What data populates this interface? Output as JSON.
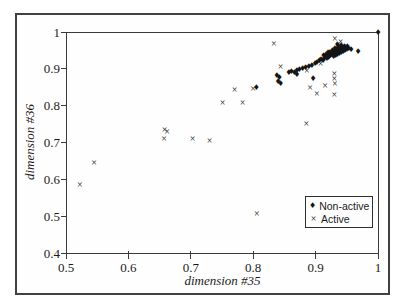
{
  "figure": {
    "background_color": "#ffffff",
    "frame_color": "#414141",
    "axis_color": "#3a3a3a",
    "marker_color": "#141414"
  },
  "chart_data": {
    "type": "scatter",
    "title": "",
    "xlabel": "dimension #35",
    "ylabel": "dimension #36",
    "xlim": [
      0.5,
      1.0
    ],
    "ylim": [
      0.4,
      1.0
    ],
    "grid": false,
    "x_ticks": [
      {
        "label": "0.5",
        "value": 0.5
      },
      {
        "label": "0.6",
        "value": 0.6
      },
      {
        "label": "0.7",
        "value": 0.7
      },
      {
        "label": "0.8",
        "value": 0.8
      },
      {
        "label": "0.9",
        "value": 0.9
      },
      {
        "label": "1",
        "value": 1.0
      }
    ],
    "y_ticks": [
      {
        "label": "1",
        "value": 1.0
      },
      {
        "label": "0.9",
        "value": 0.9
      },
      {
        "label": "0.8",
        "value": 0.8
      },
      {
        "label": "0.7",
        "value": 0.7
      },
      {
        "label": "0.6",
        "value": 0.6
      },
      {
        "label": "0.5",
        "value": 0.5
      },
      {
        "label": "0.4",
        "value": 0.4
      }
    ],
    "glyphs": {
      "diamond": "♦",
      "x": "×"
    },
    "legend": {
      "position": "lower-right",
      "entries": [
        {
          "label": "Non-active",
          "marker": "diamond"
        },
        {
          "label": "Active",
          "marker": "x"
        }
      ]
    },
    "series": [
      {
        "name": "Non-active",
        "marker": "diamond",
        "points": [
          [
            1.0,
            0.997
          ],
          [
            0.957,
            0.951
          ],
          [
            0.968,
            0.946
          ],
          [
            0.906,
            0.921
          ],
          [
            0.909,
            0.925
          ],
          [
            0.912,
            0.922
          ],
          [
            0.914,
            0.928
          ],
          [
            0.916,
            0.932
          ],
          [
            0.918,
            0.926
          ],
          [
            0.919,
            0.934
          ],
          [
            0.921,
            0.93
          ],
          [
            0.922,
            0.938
          ],
          [
            0.924,
            0.934
          ],
          [
            0.925,
            0.941
          ],
          [
            0.926,
            0.937
          ],
          [
            0.928,
            0.944
          ],
          [
            0.929,
            0.933
          ],
          [
            0.93,
            0.94
          ],
          [
            0.931,
            0.947
          ],
          [
            0.932,
            0.936
          ],
          [
            0.933,
            0.943
          ],
          [
            0.934,
            0.95
          ],
          [
            0.935,
            0.938
          ],
          [
            0.936,
            0.945
          ],
          [
            0.937,
            0.952
          ],
          [
            0.938,
            0.941
          ],
          [
            0.939,
            0.948
          ],
          [
            0.94,
            0.955
          ],
          [
            0.941,
            0.944
          ],
          [
            0.942,
            0.95
          ],
          [
            0.943,
            0.957
          ],
          [
            0.944,
            0.946
          ],
          [
            0.945,
            0.953
          ],
          [
            0.946,
            0.96
          ],
          [
            0.947,
            0.949
          ],
          [
            0.948,
            0.956
          ],
          [
            0.95,
            0.952
          ],
          [
            0.951,
            0.958
          ],
          [
            0.953,
            0.954
          ],
          [
            0.927,
            0.948
          ],
          [
            0.923,
            0.944
          ],
          [
            0.917,
            0.938
          ],
          [
            0.913,
            0.934
          ],
          [
            0.92,
            0.942
          ],
          [
            0.936,
            0.958
          ],
          [
            0.931,
            0.954
          ],
          [
            0.941,
            0.962
          ],
          [
            0.935,
            0.964
          ],
          [
            0.857,
            0.888
          ],
          [
            0.861,
            0.892
          ],
          [
            0.866,
            0.89
          ],
          [
            0.87,
            0.895
          ],
          [
            0.874,
            0.898
          ],
          [
            0.879,
            0.9
          ],
          [
            0.884,
            0.903
          ],
          [
            0.889,
            0.906
          ],
          [
            0.894,
            0.909
          ],
          [
            0.899,
            0.913
          ],
          [
            0.902,
            0.917
          ],
          [
            0.838,
            0.88
          ],
          [
            0.842,
            0.874
          ],
          [
            0.84,
            0.865
          ],
          [
            0.844,
            0.859
          ],
          [
            0.87,
            0.883
          ],
          [
            0.896,
            0.872
          ],
          [
            0.805,
            0.847
          ]
        ]
      },
      {
        "name": "Active",
        "marker": "x",
        "points": [
          [
            0.522,
            0.585
          ],
          [
            0.545,
            0.645
          ],
          [
            0.658,
            0.735
          ],
          [
            0.662,
            0.728
          ],
          [
            0.657,
            0.71
          ],
          [
            0.703,
            0.71
          ],
          [
            0.73,
            0.705
          ],
          [
            0.751,
            0.808
          ],
          [
            0.783,
            0.808
          ],
          [
            0.77,
            0.843
          ],
          [
            0.8,
            0.845
          ],
          [
            0.806,
            0.505
          ],
          [
            0.833,
            0.968
          ],
          [
            0.844,
            0.905
          ],
          [
            0.886,
            0.894
          ],
          [
            0.885,
            0.75
          ],
          [
            0.891,
            0.847
          ],
          [
            0.902,
            0.831
          ],
          [
            0.915,
            0.853
          ],
          [
            0.908,
            0.912
          ],
          [
            0.91,
            0.924
          ],
          [
            0.93,
            0.886
          ],
          [
            0.93,
            0.872
          ],
          [
            0.931,
            0.86
          ],
          [
            0.93,
            0.828
          ],
          [
            0.931,
            0.982
          ],
          [
            0.94,
            0.974
          ]
        ]
      }
    ]
  }
}
